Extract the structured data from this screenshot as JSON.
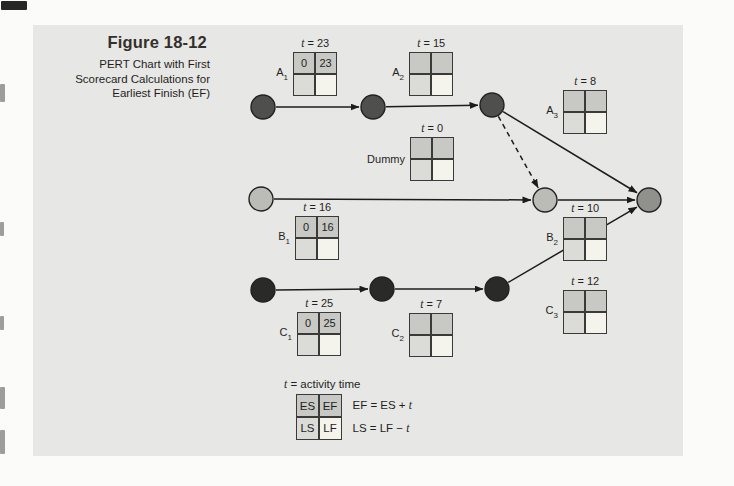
{
  "figure": {
    "title": "Figure 18-12",
    "subtitle_lines": [
      "PERT Chart with First",
      "Scorecard Calculations for",
      "Earliest Finish (EF)"
    ]
  },
  "symbols": {
    "t": "t",
    "eq": " = "
  },
  "diagram": {
    "nodes": [
      {
        "id": "start-a",
        "x": 263,
        "y": 107,
        "fill": "node_dark_gray"
      },
      {
        "id": "mid-a",
        "x": 373,
        "y": 107,
        "fill": "node_dark_gray"
      },
      {
        "id": "end-a",
        "x": 492,
        "y": 105,
        "fill": "node_dark_gray"
      },
      {
        "id": "start-b",
        "x": 261,
        "y": 199,
        "fill": "node_light_gray"
      },
      {
        "id": "merge",
        "x": 545,
        "y": 200,
        "fill": "node_light_gray"
      },
      {
        "id": "finish",
        "x": 649,
        "y": 200,
        "fill": "node_medium_gray"
      },
      {
        "id": "start-c",
        "x": 263,
        "y": 290,
        "fill": "node_black"
      },
      {
        "id": "mid-c",
        "x": 382,
        "y": 289,
        "fill": "node_black"
      },
      {
        "id": "end-c",
        "x": 497,
        "y": 289,
        "fill": "node_black"
      }
    ],
    "edges": [
      {
        "from": "start-c",
        "to": "mid-c",
        "dashed": false
      },
      {
        "from": "mid-c",
        "to": "end-c",
        "dashed": false
      },
      {
        "from": "end-c",
        "to": "finish",
        "dashed": false
      },
      {
        "from": "start-a",
        "to": "mid-a",
        "dashed": false
      },
      {
        "from": "mid-a",
        "to": "end-a",
        "dashed": false
      },
      {
        "from": "end-a",
        "to": "finish",
        "dashed": false
      },
      {
        "from": "end-a",
        "to": "merge",
        "dashed": true
      },
      {
        "from": "start-b",
        "to": "merge",
        "dashed": false
      },
      {
        "from": "merge",
        "to": "finish",
        "dashed": false
      }
    ],
    "cards": [
      {
        "id": "A1",
        "label": "A",
        "sub": "1",
        "t_value": "23",
        "es": "0",
        "ef": "23",
        "x": 293,
        "y": 52
      },
      {
        "id": "A2",
        "label": "A",
        "sub": "2",
        "t_value": "15",
        "es": "",
        "ef": "",
        "x": 409,
        "y": 52
      },
      {
        "id": "A3",
        "label": "A",
        "sub": "3",
        "t_value": "8",
        "es": "",
        "ef": "",
        "x": 563,
        "y": 90
      },
      {
        "id": "Dummy",
        "label": "Dummy",
        "sub": "",
        "t_value": "0",
        "es": "",
        "ef": "",
        "x": 410,
        "y": 137
      },
      {
        "id": "B1",
        "label": "B",
        "sub": "1",
        "t_value": "16",
        "es": "0",
        "ef": "16",
        "x": 295,
        "y": 216
      },
      {
        "id": "B2",
        "label": "B",
        "sub": "2",
        "t_value": "10",
        "es": "",
        "ef": "",
        "x": 563,
        "y": 217
      },
      {
        "id": "C1",
        "label": "C",
        "sub": "1",
        "t_value": "25",
        "es": "0",
        "ef": "25",
        "x": 297,
        "y": 312
      },
      {
        "id": "C2",
        "label": "C",
        "sub": "2",
        "t_value": "7",
        "es": "",
        "ef": "",
        "x": 409,
        "y": 313
      },
      {
        "id": "C3",
        "label": "C",
        "sub": "3",
        "t_value": "12",
        "es": "",
        "ef": "",
        "x": 563,
        "y": 290
      }
    ]
  },
  "legend": {
    "t_definition": " = activity time",
    "cells": {
      "es": "ES",
      "ef": "EF",
      "ls": "LS",
      "lf": "LF"
    },
    "formula_ef": "EF = ES + ",
    "formula_ls": "LS = LF − "
  },
  "colors": {
    "page_bg": "#fbfbfa",
    "panel_bg": "#e7e7e5",
    "line": "#1c1c1c",
    "node_stroke": "#222220",
    "cell_shaded": "#c8c8c4",
    "cell_light": "#dbdbd7",
    "cell_cream": "#f4f3ec",
    "card_border": "#3a3a38",
    "node_dark_gray": "#4f4f4d",
    "node_light_gray": "#bbbbb7",
    "node_medium_gray": "#90908c",
    "node_black": "#2a2a28",
    "title_color": "#33302b",
    "text_color": "#1f1f1d"
  }
}
